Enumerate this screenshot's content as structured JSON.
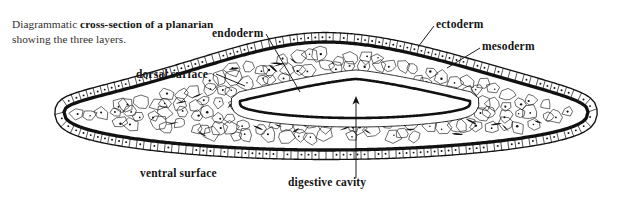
{
  "figure": {
    "title": "Diagrammatic cross-section of a planarian showing the three layers.",
    "caption_prefix": "Diagrammatic ",
    "caption_bold": "cross-section of a planarian",
    "caption_suffix": " showing the three layers.",
    "background_color": "#ffffff",
    "ink_color": "#111111"
  },
  "labels": {
    "endoderm": "endoderm",
    "ectoderm": "ectoderm",
    "mesoderm": "mesoderm",
    "dorsal_surface": "dorsal surface",
    "ventral_surface": "ventral surface",
    "digestive_cavity": "digestive cavity"
  },
  "anatomy": {
    "layers": [
      "ectoderm",
      "mesoderm",
      "endoderm"
    ],
    "layer_count": 3,
    "surfaces": [
      "dorsal surface",
      "ventral surface"
    ],
    "cavity": "digestive cavity",
    "cavity_shape": "flattened chevron lumen",
    "ectoderm_description": "outer ciliated epithelium of small squarish cells",
    "mesoderm_description": "parenchyma of irregular polygonal cells filling the body",
    "endoderm_description": "columnar epithelium lining the digestive cavity",
    "cilia": "dense along ventral surface and body margins"
  },
  "chart_data": {
    "type": "diagram",
    "title": "Diagrammatic cross-section of a planarian showing the three layers.",
    "annotations": [
      {
        "label": "endoderm",
        "anchor_x": 292,
        "anchor_y": 98,
        "text_x": 212,
        "text_y": 33
      },
      {
        "label": "ectoderm",
        "anchor_x": 424,
        "anchor_y": 48,
        "text_x": 436,
        "text_y": 24
      },
      {
        "label": "mesoderm",
        "anchor_x": 455,
        "anchor_y": 66,
        "text_x": 482,
        "text_y": 46
      },
      {
        "label": "dorsal surface",
        "anchor_x": 224,
        "anchor_y": 83,
        "text_x": 136,
        "text_y": 74
      },
      {
        "label": "ventral surface",
        "anchor_x": 0,
        "anchor_y": 0,
        "text_x": 140,
        "text_y": 173
      },
      {
        "label": "digestive cavity",
        "anchor_x": 356,
        "anchor_y": 104,
        "text_x": 288,
        "text_y": 182
      }
    ]
  }
}
